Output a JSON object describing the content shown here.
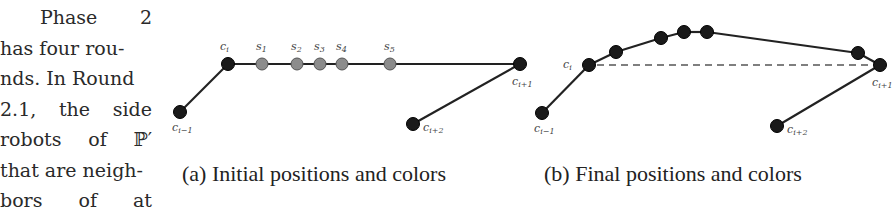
{
  "body_text": {
    "lines": [
      [
        "Phase",
        "2"
      ],
      [
        "has four rou-"
      ],
      [
        "nds. In Round"
      ],
      [
        "2.1,",
        "the",
        "side"
      ],
      [
        "robots",
        "of",
        "ℙ′"
      ],
      [
        "that are neigh-"
      ],
      [
        "bors",
        "of",
        "at"
      ]
    ]
  },
  "figure_a": {
    "caption": "(a) Initial positions and colors",
    "nodes": [
      {
        "id": "c_i-1",
        "label_base": "c",
        "label_sub": "i−1",
        "color": "black"
      },
      {
        "id": "c_i",
        "label_base": "c",
        "label_sub": "i",
        "color": "black"
      },
      {
        "id": "s1",
        "label_base": "s",
        "label_sub": "1",
        "color": "gray"
      },
      {
        "id": "s2",
        "label_base": "s",
        "label_sub": "2",
        "color": "gray"
      },
      {
        "id": "s3",
        "label_base": "s",
        "label_sub": "3",
        "color": "gray"
      },
      {
        "id": "s4",
        "label_base": "s",
        "label_sub": "4",
        "color": "gray"
      },
      {
        "id": "s5",
        "label_base": "s",
        "label_sub": "5",
        "color": "gray"
      },
      {
        "id": "c_i+1",
        "label_base": "c",
        "label_sub": "i+1",
        "color": "black"
      },
      {
        "id": "c_i+2",
        "label_base": "c",
        "label_sub": "i+2",
        "color": "black"
      }
    ]
  },
  "figure_b": {
    "caption": "(b) Final positions and colors",
    "nodes": [
      {
        "id": "c_i-1",
        "label_base": "c",
        "label_sub": "i−1",
        "color": "black"
      },
      {
        "id": "c_i",
        "label_base": "c",
        "label_sub": "i",
        "color": "black"
      },
      {
        "id": "r1",
        "label_base": "",
        "label_sub": "",
        "color": "black"
      },
      {
        "id": "r2",
        "label_base": "",
        "label_sub": "",
        "color": "black"
      },
      {
        "id": "r3",
        "label_base": "",
        "label_sub": "",
        "color": "black"
      },
      {
        "id": "r4",
        "label_base": "",
        "label_sub": "",
        "color": "black"
      },
      {
        "id": "r5",
        "label_base": "",
        "label_sub": "",
        "color": "black"
      },
      {
        "id": "c_i+1",
        "label_base": "c",
        "label_sub": "i+1",
        "color": "black"
      },
      {
        "id": "c_i+2",
        "label_base": "c",
        "label_sub": "i+2",
        "color": "black"
      }
    ],
    "dashed_segment": [
      "c_i",
      "c_i+1"
    ]
  },
  "colors": {
    "node_black": "#1a1a1a",
    "node_gray": "#8c8c8c",
    "edge": "#222222",
    "dashed": "#555555"
  }
}
